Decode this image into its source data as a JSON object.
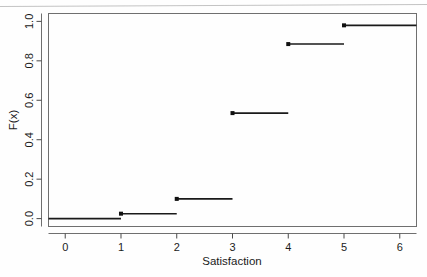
{
  "figure": {
    "background_color": "#fefefe",
    "frame_color": "#6f6f6f",
    "line_color": "#1a1a1a"
  },
  "chart_data": {
    "type": "line",
    "subtype": "ecdf-step",
    "title": "",
    "xlabel": "Satisfaction",
    "ylabel": "F(x)",
    "xlim": [
      -0.3,
      6.3
    ],
    "ylim": [
      -0.04,
      1.04
    ],
    "xticks": [
      0,
      1,
      2,
      3,
      4,
      5,
      6
    ],
    "xtick_labels": [
      "0",
      "1",
      "2",
      "3",
      "4",
      "5",
      "6"
    ],
    "yticks": [
      0.0,
      0.2,
      0.4,
      0.6,
      0.8,
      1.0
    ],
    "ytick_labels": [
      "0.0",
      "0.2",
      "0.4",
      "0.6",
      "0.8",
      "1.0"
    ],
    "grid": false,
    "legend": null,
    "x": [
      1,
      2,
      3,
      4,
      5
    ],
    "y": [
      0.025,
      0.1,
      0.535,
      0.885,
      0.98
    ],
    "steps": [
      {
        "x_start": -0.3,
        "x_end": 1,
        "value": 0.0,
        "point_at_start": false
      },
      {
        "x_start": 1,
        "x_end": 2,
        "value": 0.025,
        "point_at_start": true
      },
      {
        "x_start": 2,
        "x_end": 3,
        "value": 0.1,
        "point_at_start": true
      },
      {
        "x_start": 3,
        "x_end": 4,
        "value": 0.535,
        "point_at_start": true
      },
      {
        "x_start": 4,
        "x_end": 5,
        "value": 0.885,
        "point_at_start": true
      },
      {
        "x_start": 5,
        "x_end": 6.3,
        "value": 0.98,
        "point_at_start": true
      }
    ]
  }
}
